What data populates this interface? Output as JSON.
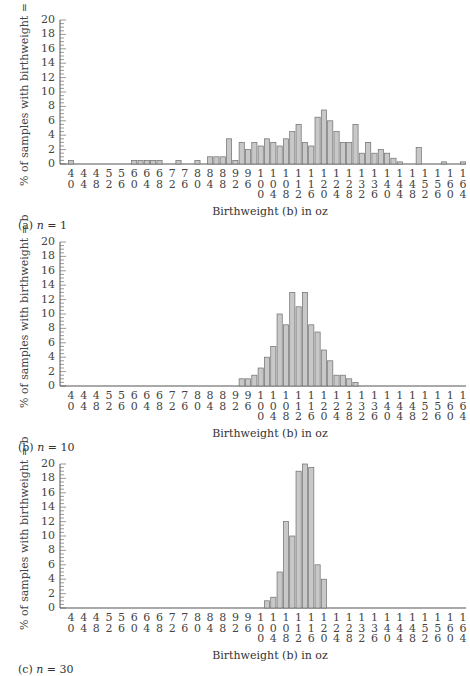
{
  "chart_data": [
    {
      "type": "bar",
      "title": "(a) n = 1",
      "caption": "(a) n = 1",
      "xlabel": "Birthweight (b) in oz",
      "ylabel": "% of samples with birthweight = b",
      "ylim": [
        0,
        20
      ],
      "yticks": [
        0,
        2,
        4,
        6,
        8,
        10,
        12,
        14,
        16,
        18,
        20
      ],
      "xtick_labels": [
        40,
        44,
        48,
        52,
        56,
        60,
        64,
        68,
        72,
        76,
        80,
        84,
        88,
        92,
        96,
        100,
        104,
        108,
        112,
        116,
        120,
        124,
        128,
        132,
        136,
        140,
        144,
        148,
        152,
        156,
        160,
        164
      ],
      "x": [
        40,
        60,
        62,
        64,
        66,
        68,
        74,
        80,
        84,
        86,
        88,
        90,
        92,
        94,
        96,
        98,
        100,
        102,
        104,
        106,
        108,
        110,
        112,
        114,
        116,
        118,
        120,
        122,
        124,
        126,
        128,
        130,
        132,
        134,
        136,
        138,
        140,
        142,
        144,
        150,
        158,
        164
      ],
      "values": [
        0.5,
        0.5,
        0.5,
        0.5,
        0.5,
        0.5,
        0.5,
        0.5,
        1,
        1,
        1,
        3.5,
        0.5,
        3,
        2,
        3,
        2.5,
        3.5,
        3,
        2.5,
        3.5,
        4.5,
        5.5,
        3,
        2.5,
        6.5,
        7.5,
        6,
        4.5,
        3,
        3,
        5.5,
        1.5,
        3,
        1.5,
        2,
        1.5,
        0.8,
        0.3,
        2.3,
        0.3,
        0.3
      ]
    },
    {
      "type": "bar",
      "title": "(b) n = 10",
      "caption": "(b) n = 10",
      "xlabel": "Birthweight (b) in oz",
      "ylabel": "% of samples with birthweight = b",
      "ylim": [
        0,
        20
      ],
      "yticks": [
        0,
        2,
        4,
        6,
        8,
        10,
        12,
        14,
        16,
        18,
        20
      ],
      "xtick_labels": [
        40,
        44,
        48,
        52,
        56,
        60,
        64,
        68,
        72,
        76,
        80,
        84,
        88,
        92,
        96,
        100,
        104,
        108,
        112,
        116,
        120,
        124,
        128,
        132,
        136,
        140,
        144,
        148,
        152,
        156,
        160,
        164
      ],
      "x": [
        94,
        96,
        98,
        100,
        102,
        104,
        106,
        108,
        110,
        112,
        114,
        116,
        118,
        120,
        122,
        124,
        126,
        128,
        130
      ],
      "values": [
        1,
        1,
        1.5,
        2.5,
        4,
        5.5,
        10,
        8.5,
        13,
        11,
        13,
        8.5,
        7.5,
        5,
        3.5,
        1.5,
        1.5,
        1,
        0.5
      ]
    },
    {
      "type": "bar",
      "title": "(c) n = 30",
      "caption": "(c) n = 30",
      "xlabel": "Birthweight (b) in oz",
      "ylabel": "% of samples with birthweight = b",
      "ylim": [
        0,
        20
      ],
      "yticks": [
        0,
        2,
        4,
        6,
        8,
        10,
        12,
        14,
        16,
        18,
        20
      ],
      "xtick_labels": [
        40,
        44,
        48,
        52,
        56,
        60,
        64,
        68,
        72,
        76,
        80,
        84,
        88,
        92,
        96,
        100,
        104,
        108,
        112,
        116,
        120,
        124,
        128,
        132,
        136,
        140,
        144,
        148,
        152,
        156,
        160,
        164
      ],
      "x": [
        102,
        104,
        106,
        108,
        110,
        112,
        114,
        116,
        118,
        120
      ],
      "values": [
        1,
        1.5,
        5,
        12,
        10,
        19,
        20,
        19.5,
        6,
        4
      ]
    }
  ],
  "panels": [
    {
      "caption": "(a) n = 1",
      "xlabel": "Birthweight (b) in oz",
      "ylabel": "% of samples with birthweight = b"
    },
    {
      "caption": "(b) n = 10",
      "xlabel": "Birthweight (b) in oz",
      "ylabel": "% of samples with birthweight = b"
    },
    {
      "caption": "(c) n = 30",
      "xlabel": "Birthweight (b) in oz",
      "ylabel": "% of samples with birthweight = b"
    }
  ],
  "colors": {
    "bar_fill": "#c8c8c8",
    "bar_stroke": "#6e6e6e",
    "axis": "#555555"
  }
}
